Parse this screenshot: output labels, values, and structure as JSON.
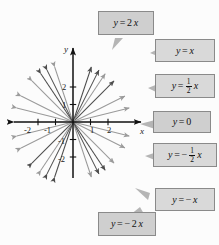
{
  "figure": {
    "type": "coordinate-plane-line-family",
    "background_color": "#fcfcfc",
    "callout_fill": "#cfcfcf",
    "callout_border": "#8a8a8a",
    "axis_color": "#111111",
    "line_dark_color": "#4d4d4d",
    "line_light_color": "#9a9a9a"
  },
  "axes": {
    "x_label": "x",
    "y_label": "y",
    "x_ticks": [
      "-2",
      "-1",
      "1",
      "2"
    ],
    "y_ticks": [
      "2",
      "1",
      "-1",
      "-2"
    ],
    "x_range": [
      -3.4,
      3.4
    ],
    "y_range": [
      -3.2,
      3.2
    ],
    "origin_px": [
      73,
      122
    ],
    "unit_px": 17.5
  },
  "callouts": [
    {
      "id": "y-2x",
      "text": "y = 2x",
      "slope": 2,
      "position": "top"
    },
    {
      "id": "y-x",
      "text": "y = x",
      "slope": 1,
      "position": "right-1"
    },
    {
      "id": "y-half-x",
      "text": "y = 1/2 x",
      "slope": 0.5,
      "position": "right-2"
    },
    {
      "id": "y-0",
      "text": "y = 0",
      "slope": 0,
      "position": "right-3"
    },
    {
      "id": "y-neg-half-x",
      "text": "y = -1/2 x",
      "slope": -0.5,
      "position": "right-4"
    },
    {
      "id": "y-neg-x",
      "text": "y = -x",
      "slope": -1,
      "position": "right-5"
    },
    {
      "id": "y-neg-2x",
      "text": "y = -2x",
      "slope": -2,
      "position": "bottom"
    }
  ],
  "chart_data": {
    "type": "line",
    "title": "",
    "xlabel": "x",
    "ylabel": "y",
    "xlim": [
      -3.4,
      3.4
    ],
    "ylim": [
      -3.2,
      3.2
    ],
    "grid": false,
    "legend": "callout-boxes",
    "series": [
      {
        "name": "y = 2x",
        "equation": "y = 2x",
        "slope": 2,
        "intercept": 0,
        "color": "#4d4d4d",
        "arrows": "both"
      },
      {
        "name": "y = x",
        "equation": "y = x",
        "slope": 1,
        "intercept": 0,
        "color": "#4d4d4d",
        "arrows": "both"
      },
      {
        "name": "y = 1/2 x",
        "equation": "y = (1/2)x",
        "slope": 0.5,
        "intercept": 0,
        "color": "#9a9a9a",
        "arrows": "both"
      },
      {
        "name": "y = 0",
        "equation": "y = 0",
        "slope": 0,
        "intercept": 0,
        "color": "#111111",
        "arrows": "both"
      },
      {
        "name": "y = -1/2 x",
        "equation": "y = -(1/2)x",
        "slope": -0.5,
        "intercept": 0,
        "color": "#9a9a9a",
        "arrows": "both"
      },
      {
        "name": "y = -x",
        "equation": "y = -x",
        "slope": -1,
        "intercept": 0,
        "color": "#9a9a9a",
        "arrows": "both"
      },
      {
        "name": "y = -2x",
        "equation": "y = -2x",
        "slope": -2,
        "intercept": 0,
        "color": "#4d4d4d",
        "arrows": "both"
      },
      {
        "name": "y = 3x",
        "equation": "y = 3x",
        "slope": 3,
        "intercept": 0,
        "color": "#4d4d4d",
        "arrows": "both"
      },
      {
        "name": "y = -3x",
        "equation": "y = -3x",
        "slope": -3,
        "intercept": 0,
        "color": "#9a9a9a",
        "arrows": "both"
      },
      {
        "name": "y = 3/2 x",
        "equation": "y = (3/2)x",
        "slope": 1.5,
        "intercept": 0,
        "color": "#9a9a9a",
        "arrows": "both"
      },
      {
        "name": "y = -3/2 x",
        "equation": "y = -(3/2)x",
        "slope": -1.5,
        "intercept": 0,
        "color": "#4d4d4d",
        "arrows": "both"
      },
      {
        "name": "y = 1/4 x",
        "equation": "y = (1/4)x",
        "slope": 0.25,
        "intercept": 0,
        "color": "#9a9a9a",
        "arrows": "both"
      },
      {
        "name": "y = -1/4 x",
        "equation": "y = -(1/4)x",
        "slope": -0.25,
        "intercept": 0,
        "color": "#9a9a9a",
        "arrows": "both"
      }
    ]
  }
}
